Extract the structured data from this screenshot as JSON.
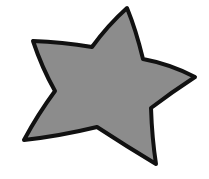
{
  "image": {
    "width": 209,
    "height": 179,
    "background": "#ffffff"
  },
  "shape": {
    "type": "star",
    "points": 5,
    "icon": "star-icon",
    "fill": "#8c8c8c",
    "stroke": "#111111",
    "stroke_width": 4
  }
}
